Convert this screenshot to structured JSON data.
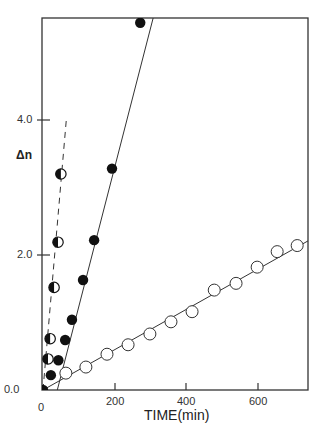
{
  "chart_data": {
    "type": "scatter",
    "title": "",
    "xlabel": "TIME(min)",
    "ylabel": "Δn",
    "xlim": [
      0,
      745
    ],
    "ylim": [
      0,
      5.5
    ],
    "x_ticks": [
      "0",
      "200",
      "400",
      "600"
    ],
    "y_ticks": [
      "0.0",
      "2.0",
      "4.0"
    ],
    "grid": false,
    "legend": null,
    "series": [
      {
        "name": "half-filled circles",
        "marker": "half-filled-circle",
        "line": "dashed",
        "x": [
          14,
          20,
          31,
          42,
          50
        ],
        "y": [
          0.46,
          0.76,
          1.52,
          2.19,
          3.2
        ],
        "fit_line": {
          "x": [
            0,
            66
          ],
          "y": [
            0,
            4.05
          ]
        }
      },
      {
        "name": "filled circles",
        "marker": "filled-circle",
        "line": "solid",
        "x": [
          0,
          22,
          43,
          62,
          81,
          112,
          143,
          193,
          272
        ],
        "y": [
          0.0,
          0.22,
          0.44,
          0.74,
          1.04,
          1.63,
          2.22,
          3.28,
          5.44
        ],
        "fit_line": {
          "x": [
            40,
            310
          ],
          "y": [
            0.0,
            5.55
          ]
        }
      },
      {
        "name": "open circles",
        "marker": "open-circle",
        "line": "solid",
        "x": [
          64,
          120,
          179,
          238,
          299,
          358,
          417,
          479,
          540,
          599,
          655,
          711
        ],
        "y": [
          0.25,
          0.34,
          0.53,
          0.67,
          0.83,
          1.01,
          1.16,
          1.48,
          1.58,
          1.82,
          2.05,
          2.14
        ],
        "fit_line": {
          "x": [
            0,
            745
          ],
          "y": [
            0.0,
            2.22
          ]
        }
      }
    ]
  },
  "axes": {
    "xlabel": "TIME(min)",
    "ylabel": "Δn",
    "x_ticks": [
      "0",
      "200",
      "400",
      "600"
    ],
    "y_ticks": [
      "0.0",
      "2.0",
      "4.0"
    ]
  }
}
